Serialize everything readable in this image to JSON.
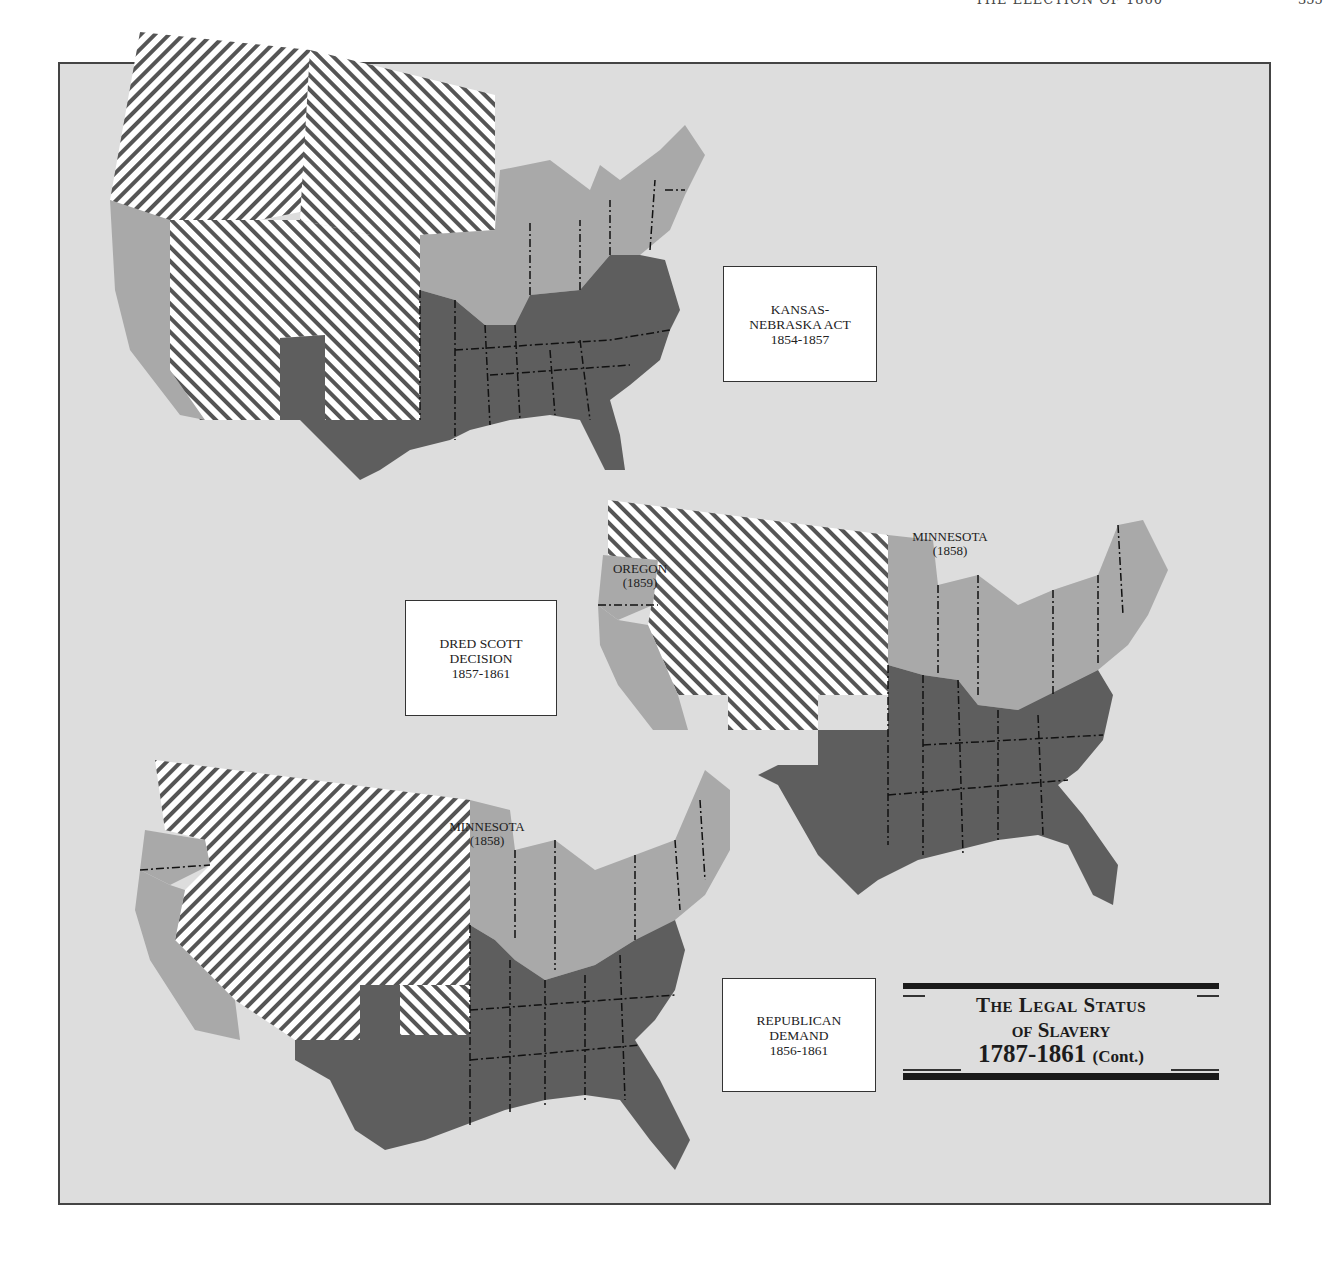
{
  "page": {
    "running_head": "THE ELECTION OF 1860",
    "page_number": "355"
  },
  "title": {
    "line1": "The Legal Status",
    "line2": "of Slavery",
    "line3": "1787-1861",
    "line3_suffix": "(Cont.)"
  },
  "legend_colors": {
    "slave_states": "#5e5e5e",
    "free_states": "#a9a9a9",
    "territories_hatched": "#ffffff",
    "hatch_line": "#555555",
    "background": "#dddddd"
  },
  "maps": [
    {
      "id": "kansas-nebraska",
      "label_lines": [
        "KANSAS-",
        "NEBRASKA ACT",
        "1854-1857"
      ]
    },
    {
      "id": "dred-scott",
      "label_lines": [
        "DRED SCOTT",
        "DECISION",
        "1857-1861"
      ],
      "annotations": [
        {
          "name": "OREGON",
          "year": "(1859)"
        },
        {
          "name": "MINNESOTA",
          "year": "(1858)"
        }
      ]
    },
    {
      "id": "republican-demand",
      "label_lines": [
        "REPUBLICAN",
        "DEMAND",
        "1856-1861"
      ],
      "annotations": [
        {
          "name": "MINNESOTA",
          "year": "(1858)"
        }
      ]
    }
  ]
}
